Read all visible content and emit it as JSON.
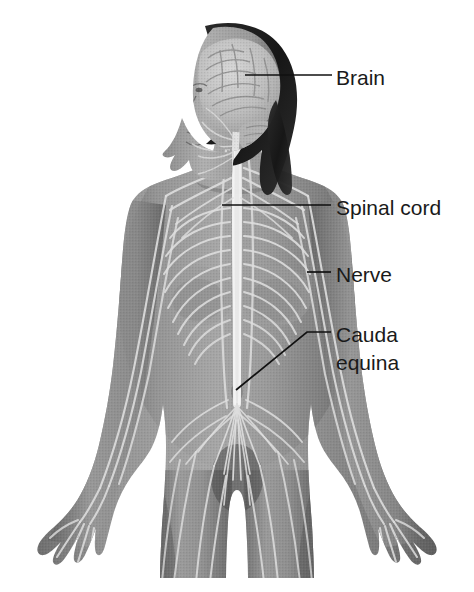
{
  "figure": {
    "background_color": "#ffffff",
    "illustration_style": "grayscale halftone medical illustration",
    "colors": {
      "background": "#ffffff",
      "skin_mid": "#8a8a8a",
      "skin_shadow": "#5e5e5e",
      "skin_light": "#b4b4b4",
      "hair_dark": "#1c1c1c",
      "nerve_light": "#dcdcdc",
      "brain_light": "#c9c9c9",
      "label_text": "#1a1a1a",
      "leader_line": "#111111"
    }
  },
  "labels": [
    {
      "id": "brain",
      "text": "Brain",
      "lines": [
        "Brain"
      ],
      "text_x": 336,
      "text_y": 75,
      "leader_points": "245,75 332,75"
    },
    {
      "id": "spinal-cord",
      "text": "Spinal cord",
      "lines": [
        "Spinal cord"
      ],
      "text_x": 336,
      "text_y": 205,
      "leader_points": "222,205 331,205"
    },
    {
      "id": "nerve",
      "text": "Nerve",
      "lines": [
        "Nerve"
      ],
      "text_x": 336,
      "text_y": 272,
      "leader_points": "307,272 331,272"
    },
    {
      "id": "cauda-equina",
      "text": "Cauda equina",
      "lines": [
        "Cauda",
        "equina"
      ],
      "text_x": 336,
      "text_y": 332,
      "leader_points": "236,390 307,332 331,332"
    }
  ],
  "anatomy_parts": [
    {
      "id": "brain",
      "name": "Brain",
      "region": "head",
      "description": "Cerebrum with visible gyri and sulci, cerebellum below, shown in lateral profile within the skull"
    },
    {
      "id": "spinal-cord",
      "name": "Spinal cord",
      "region": "vertebral column",
      "description": "Vertical pale cord descending the midline from the brainstem through the thorax"
    },
    {
      "id": "nerve",
      "name": "Nerve",
      "region": "thorax",
      "description": "Peripheral intercostal nerves branching laterally from the spinal cord around the rib cage"
    },
    {
      "id": "cauda-equina",
      "name": "Cauda equina",
      "region": "lumbar",
      "description": "Fan-shaped bundle of nerve roots spreading from the lower end of the spinal cord"
    },
    {
      "id": "brachial-plexus",
      "name": "Brachial plexus",
      "region": "shoulder",
      "description": "Nerve network at the shoulders supplying the arms"
    },
    {
      "id": "hair",
      "name": "Hair",
      "region": "head",
      "description": "Long dark hair framing the head and falling past the shoulders"
    },
    {
      "id": "left-arm",
      "name": "Left arm",
      "region": "upper limb",
      "description": "Arm extended downward and outward with open palm and splayed fingers"
    },
    {
      "id": "right-arm",
      "name": "Right arm",
      "region": "upper limb",
      "description": "Arm extended downward and outward with open palm and splayed fingers"
    }
  ]
}
